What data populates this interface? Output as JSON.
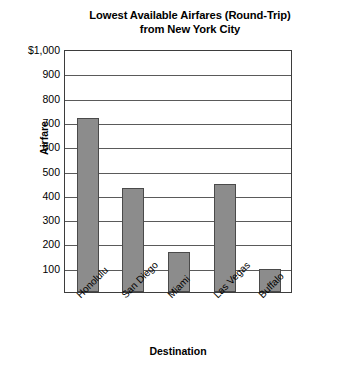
{
  "chart_data": {
    "type": "bar",
    "title": "Lowest Available Airfares (Round-Trip) from New York City",
    "title_lines": [
      "Lowest Available Airfares (Round-Trip)",
      "from New York City"
    ],
    "xlabel": "Destination",
    "ylabel": "Airfare",
    "categories": [
      "Honolulu",
      "San Diego",
      "Miami",
      "Las Vegas",
      "Buffalo"
    ],
    "values": [
      715,
      430,
      165,
      445,
      95
    ],
    "ylim": [
      0,
      1000
    ],
    "ytick_values": [
      1000,
      900,
      800,
      700,
      600,
      500,
      400,
      300,
      200,
      100
    ],
    "ytick_labels": [
      "$1,000",
      "900",
      "800",
      "700",
      "600",
      "500",
      "400",
      "300",
      "200",
      "100"
    ],
    "grid": "horizontal",
    "legend": "none",
    "bar_color": "#8c8c8c",
    "bar_edge_color": "#4a4a4a",
    "axis_color": "#3d3d3d",
    "gridline_color": "#5a5a5a",
    "background_color": "#ffffff"
  }
}
